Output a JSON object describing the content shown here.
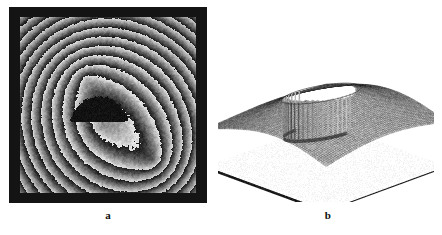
{
  "figure": {
    "background_color": "#ffffff",
    "width": 442,
    "height": 235,
    "panel_count": 2
  },
  "panel_a": {
    "caption": "a",
    "kind": "wrapped-phase-map",
    "frame_color": "#141414",
    "frame": {
      "x": 9,
      "y": 7,
      "w": 198,
      "h": 196,
      "border": 10
    },
    "plot": {
      "x": 11,
      "y": 10,
      "w": 176,
      "h": 176
    },
    "gray_min": "#1a1a1a",
    "gray_max": "#ededed",
    "background_gray": "#6e6e6e",
    "obstruction": {
      "label": "central-dark-disk",
      "cx": 79,
      "cy": 108,
      "r": 29,
      "color": "#0d0d0d"
    },
    "fringe_centers": [
      {
        "cx": 66,
        "cy": 60,
        "period": 23,
        "phase": 0.0,
        "weight": 1.0
      },
      {
        "cx": 133,
        "cy": 143,
        "period": 20,
        "phase": 1.2,
        "weight": 1.0
      },
      {
        "cx": 79,
        "cy": 108,
        "period": 26,
        "phase": 0.4,
        "weight": 0.55
      }
    ],
    "tilt": {
      "gx": 0.016,
      "gy": -0.011
    },
    "noise_amplitude": 0.17,
    "wrap_range": "0 to 2π"
  },
  "panel_b": {
    "caption": "b",
    "kind": "3d-mesh-surface",
    "plot": {
      "x": 218,
      "y": 10,
      "w": 216,
      "h": 192
    },
    "mesh_color": "#3c3c3c",
    "surface_fill": "#b8b8b8",
    "baseplate_color": "#ffffff",
    "baseplate_edge_color": "#1e1e1e",
    "grid_u": 74,
    "grid_v": 74,
    "well": {
      "label": "central-cylindrical-well",
      "cx": 0.42,
      "cy": 0.46,
      "r": 0.22,
      "stripe_count": 26,
      "stripe_color": "#5a5a5a",
      "depth": 1.0
    },
    "saddle_amplitude": 0.55,
    "ridge_amplitude": 0.3
  },
  "chart_data": {
    "type": "heatmap",
    "title": "",
    "subtitle": "",
    "panels": [
      {
        "id": "a",
        "label": "a",
        "type": "heatmap",
        "description": "Wrapped (modulo 2π) phase map with sawtooth fringes and a circular obstruction",
        "colormap": "grayscale",
        "zlabel": "wrapped phase",
        "zlim": [
          0,
          6.283
        ],
        "grid": false,
        "legend": "none",
        "annotations": [
          "a"
        ]
      },
      {
        "id": "b",
        "label": "b",
        "type": "surface",
        "description": "Unwrapped phase reconstructed as a 3-D mesh surface with a central cylindrical well",
        "xlabel": "",
        "ylabel": "",
        "zlabel": "unwrapped phase",
        "grid": false,
        "legend": "none",
        "annotations": [
          "b"
        ]
      }
    ]
  }
}
